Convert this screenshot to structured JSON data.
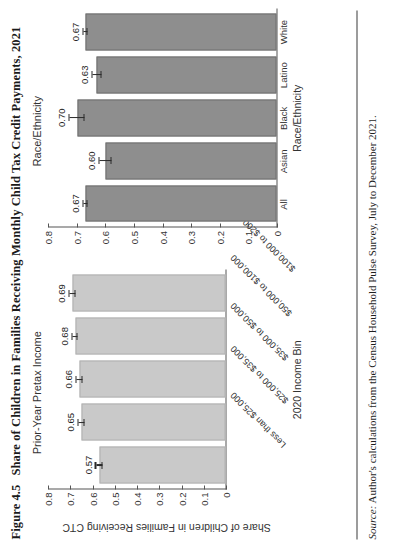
{
  "figure": {
    "number": "Figure 4.5",
    "caption": "Share of Children in Families Receiving Monthly Child Tax Credit Payments, 2021"
  },
  "axis": {
    "y_title": "Share of Children in Families Receiving CTC",
    "ticks": [
      "0.8",
      "0.7",
      "0.6",
      "0.5",
      "0.4",
      "0.3",
      "0.2",
      "0.1",
      "0"
    ]
  },
  "source": {
    "label": "Source:",
    "text": "Author's calculations from the Census Household Pulse Survey, July to December 2021."
  },
  "chart_data": [
    {
      "type": "bar",
      "title": "Prior-Year Pretax Income",
      "xlabel": "2020 Income Bin",
      "ylabel": "Share of Children in Families Receiving CTC",
      "ylim": [
        0,
        0.8
      ],
      "yticks": [
        0,
        0.1,
        0.2,
        0.3,
        0.4,
        0.5,
        0.6,
        0.7,
        0.8
      ],
      "grid": false,
      "bar_color": "#c9c9c9",
      "categories": [
        "Less than $25,000",
        "$25,000 to $35,000",
        "$35,000 to $50,000",
        "$50,000 to $100,000",
        "$100,000 to $200,000"
      ],
      "values": [
        0.57,
        0.65,
        0.66,
        0.68,
        0.69
      ],
      "value_labels": [
        "0.57",
        "0.65",
        "0.66",
        "0.68",
        "0.69"
      ],
      "errors": [
        0.015,
        0.013,
        0.013,
        0.011,
        0.013
      ]
    },
    {
      "type": "bar",
      "title": "Race/Ethnicity",
      "xlabel": "Race/Ethnicity",
      "ylabel": "Share of Children in Families Receiving CTC",
      "ylim": [
        0,
        0.8
      ],
      "yticks": [
        0,
        0.1,
        0.2,
        0.3,
        0.4,
        0.5,
        0.6,
        0.7,
        0.8
      ],
      "grid": false,
      "bar_color": "#8e8e8e",
      "categories": [
        "All",
        "Asian",
        "Black",
        "Latino",
        "White"
      ],
      "values": [
        0.67,
        0.6,
        0.7,
        0.63,
        0.67
      ],
      "value_labels": [
        "0.67",
        "0.60",
        "0.70",
        "0.63",
        "0.67"
      ],
      "errors": [
        0.006,
        0.022,
        0.025,
        0.017,
        0.008
      ]
    }
  ]
}
